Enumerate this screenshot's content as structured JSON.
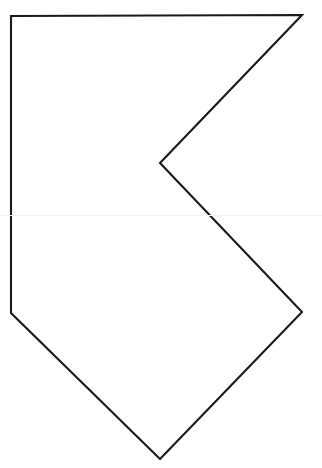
{
  "document": {
    "kind": "line-drawing",
    "title": "Concave polygon outline",
    "background_color": "#ffffff",
    "width": 322,
    "height": 468
  },
  "figure": {
    "name": "chevron-notch-polygon",
    "stroke_color": "#1a1a1a",
    "stroke_width": 2.1,
    "fill_color": "none",
    "line_join": "miter",
    "vertex_count": 7,
    "vertices": [
      {
        "label": "top-left-corner",
        "x": 11,
        "y": 16
      },
      {
        "label": "top-right-point",
        "x": 302,
        "y": 15
      },
      {
        "label": "notch-apex",
        "x": 160,
        "y": 163
      },
      {
        "label": "right-middle-point",
        "x": 302,
        "y": 312
      },
      {
        "label": "bottom-point",
        "x": 160,
        "y": 459
      },
      {
        "label": "left-bottom-corner",
        "x": 11,
        "y": 313
      }
    ],
    "path_d": "M 11 16 L 302 15 L 160 163 L 302 312 L 160 459 L 11 313 Z",
    "edges": [
      {
        "label": "top-edge",
        "from": "top-left-corner",
        "to": "top-right-point"
      },
      {
        "label": "upper-right-diagonal",
        "from": "top-right-point",
        "to": "notch-apex"
      },
      {
        "label": "notch-lower-diagonal",
        "from": "notch-apex",
        "to": "right-middle-point"
      },
      {
        "label": "lower-right-diagonal",
        "from": "right-middle-point",
        "to": "bottom-point"
      },
      {
        "label": "lower-left-diagonal",
        "from": "bottom-point",
        "to": "left-bottom-corner"
      },
      {
        "label": "left-vertical-edge",
        "from": "left-bottom-corner",
        "to": "top-left-corner"
      }
    ]
  },
  "artifacts": {
    "scan_line_y": 215,
    "scan_line_color": "#f2f2f2"
  }
}
